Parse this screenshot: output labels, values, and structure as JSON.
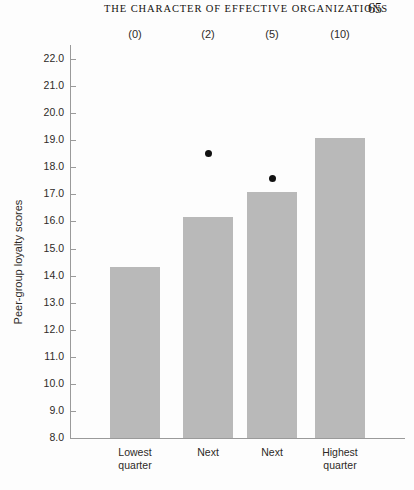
{
  "running_head": {
    "title": "THE CHARACTER OF EFFECTIVE ORGANIZATIONS",
    "page_number": "65"
  },
  "colors": {
    "bar_fill": "#b9b9b9",
    "dot_fill": "#111111",
    "axis": "#9a9a9a",
    "text": "#2d2a27",
    "page_background": "#fdfdfd"
  },
  "chart_data": {
    "type": "bar",
    "title": "",
    "xlabel": "",
    "ylabel": "Peer-group loyalty scores",
    "ylim": [
      8.0,
      22.0
    ],
    "grid": false,
    "legend": "none",
    "categories": [
      "Lowest\nquarter",
      "Next",
      "Next",
      "Highest\nquarter"
    ],
    "category_lines": [
      [
        "Lowest",
        "quarter"
      ],
      [
        "Next",
        ""
      ],
      [
        "Next",
        ""
      ],
      [
        "Highest",
        "quarter"
      ]
    ],
    "top_annotations": [
      "(0)",
      "(2)",
      "(5)",
      "(10)"
    ],
    "values": [
      14.3,
      16.15,
      17.1,
      19.1
    ],
    "ytick_labels": [
      "22.0",
      "21.0",
      "20.0",
      "19.0",
      "18.0",
      "17.0",
      "16.0",
      "15.0",
      "14.0",
      "13.0",
      "12.0",
      "11.0",
      "10.0",
      "9.0",
      "8.0"
    ],
    "yticks": [
      22.0,
      21.0,
      20.0,
      19.0,
      18.0,
      17.0,
      16.0,
      15.0,
      14.0,
      13.0,
      12.0,
      11.0,
      10.0,
      9.0,
      8.0
    ],
    "overlay_points": {
      "name": "point markers",
      "x_categories": [
        "Next",
        "Next"
      ],
      "category_indices": [
        1,
        2
      ],
      "values": [
        18.5,
        17.6
      ]
    }
  }
}
